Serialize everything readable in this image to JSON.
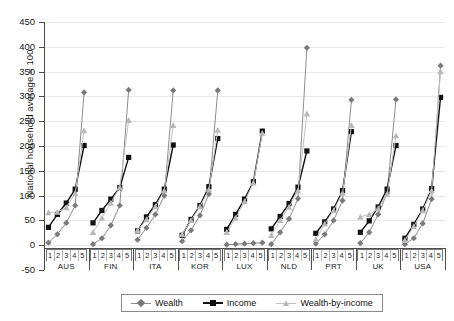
{
  "chart_data": {
    "type": "line",
    "title": "",
    "xlabel": "",
    "ylabel": "National household average = 100",
    "ylim": [
      -50,
      450
    ],
    "ytick_step": 50,
    "yticks": [
      450,
      400,
      350,
      300,
      250,
      200,
      150,
      100,
      50,
      0,
      -50
    ],
    "grid": true,
    "legend_position": "bottom",
    "categories": [
      "1",
      "2",
      "3",
      "4",
      "5"
    ],
    "groups": [
      "AUS",
      "FIN",
      "ITA",
      "KOR",
      "LUX",
      "NLD",
      "PRT",
      "UK",
      "USA"
    ],
    "series": [
      {
        "name": "Wealth",
        "marker": "diamond",
        "color": "#7a7a7a",
        "line_color": "#8d8d8d",
        "values_by_group": {
          "AUS": [
            5,
            22,
            45,
            80,
            308
          ],
          "FIN": [
            2,
            14,
            40,
            80,
            313
          ],
          "ITA": [
            11,
            35,
            62,
            100,
            312
          ],
          "KOR": [
            8,
            30,
            60,
            103,
            312
          ],
          "LUX": [
            1,
            2,
            3,
            4,
            5
          ],
          "NLD": [
            2,
            26,
            53,
            94,
            398
          ],
          "PRT": [
            3,
            22,
            50,
            90,
            293
          ],
          "UK": [
            4,
            26,
            62,
            105,
            294
          ],
          "USA": [
            2,
            14,
            44,
            93,
            362
          ]
        }
      },
      {
        "name": "Income",
        "marker": "square",
        "color": "#111111",
        "line_color": "#111111",
        "values_by_group": {
          "AUS": [
            36,
            62,
            85,
            113,
            201
          ],
          "FIN": [
            45,
            70,
            93,
            116,
            177
          ],
          "ITA": [
            29,
            57,
            82,
            113,
            202
          ],
          "KOR": [
            20,
            52,
            80,
            118,
            215
          ],
          "LUX": [
            32,
            62,
            93,
            128,
            230
          ],
          "NLD": [
            33,
            58,
            84,
            117,
            190
          ],
          "PRT": [
            24,
            47,
            73,
            110,
            229
          ],
          "UK": [
            26,
            49,
            77,
            113,
            201
          ],
          "USA": [
            14,
            42,
            73,
            114,
            298
          ]
        }
      },
      {
        "name": "Wealth-by-income",
        "marker": "triangle",
        "color": "#b8b8b8",
        "line_color": "#c2c2c2",
        "values_by_group": {
          "AUS": [
            66,
            67,
            76,
            105,
            231
          ],
          "FIN": [
            26,
            55,
            85,
            117,
            252
          ],
          "ITA": [
            30,
            52,
            78,
            110,
            242
          ],
          "KOR": [
            22,
            50,
            78,
            112,
            232
          ],
          "LUX": [
            26,
            55,
            88,
            126,
            226
          ],
          "NLD": [
            20,
            50,
            77,
            110,
            265
          ],
          "PRT": [
            12,
            43,
            70,
            105,
            242
          ],
          "UK": [
            57,
            62,
            74,
            103,
            221
          ],
          "USA": [
            10,
            38,
            70,
            110,
            350
          ]
        }
      }
    ]
  },
  "legend": {
    "items": [
      {
        "label": "Wealth"
      },
      {
        "label": "Income"
      },
      {
        "label": "Wealth-by-income"
      }
    ]
  }
}
